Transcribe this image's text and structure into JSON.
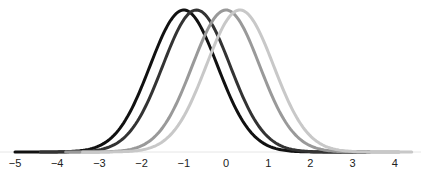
{
  "chart_data": {
    "type": "line",
    "title": "",
    "xlabel": "",
    "ylabel": "",
    "xlim": [
      -5.1,
      4.5
    ],
    "grid": false,
    "legend": null,
    "x_ticks": [
      -5,
      -4,
      -3,
      -2,
      -1,
      0,
      1,
      2,
      3,
      4
    ],
    "x_tick_labels": [
      "−5",
      "−4",
      "−3",
      "−2",
      "−1",
      "0",
      "1",
      "2",
      "3",
      "4"
    ],
    "series": [
      {
        "name": "curve-1",
        "kind": "gaussian",
        "mean": -1.0,
        "sd": 0.8,
        "x_range": [
          -5,
          3.3
        ],
        "color": "#111111"
      },
      {
        "name": "curve-2",
        "kind": "gaussian",
        "mean": -0.7,
        "sd": 0.8,
        "x_range": [
          -4.4,
          3.4
        ],
        "color": "#333333"
      },
      {
        "name": "curve-3",
        "kind": "gaussian",
        "mean": 0.0,
        "sd": 0.8,
        "x_range": [
          -3.8,
          4.1
        ],
        "color": "#999999"
      },
      {
        "name": "curve-4",
        "kind": "gaussian",
        "mean": 0.33,
        "sd": 0.8,
        "x_range": [
          -3.4,
          4.4
        ],
        "color": "#c8c8c8"
      }
    ]
  }
}
